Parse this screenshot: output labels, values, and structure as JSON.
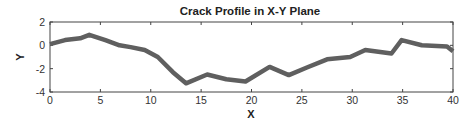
{
  "chart_data": {
    "type": "line",
    "title": "Crack Profile in X-Y Plane",
    "xlabel": "X",
    "ylabel": "Y",
    "xlim": [
      0,
      40
    ],
    "ylim": [
      -4,
      2
    ],
    "xticks": [
      0,
      5,
      10,
      15,
      20,
      25,
      30,
      35,
      40
    ],
    "yticks": [
      -4,
      -2,
      0,
      2
    ],
    "grid": false,
    "legend": null,
    "line_color": "#5f5f5f",
    "series": [
      {
        "name": "Crack Profile",
        "x": [
          0,
          1.5,
          3.0,
          3.9,
          5.5,
          6.9,
          8.0,
          9.4,
          10.7,
          12.2,
          13.5,
          15.6,
          17.5,
          19.4,
          21.8,
          23.7,
          25.5,
          27.5,
          29.8,
          31.3,
          33.9,
          34.9,
          36.9,
          39.4,
          40
        ],
        "y": [
          0.1,
          0.45,
          0.6,
          0.9,
          0.45,
          0.0,
          -0.15,
          -0.4,
          -1.0,
          -2.3,
          -3.25,
          -2.5,
          -2.9,
          -3.1,
          -1.85,
          -2.55,
          -1.9,
          -1.2,
          -1.0,
          -0.4,
          -0.7,
          0.45,
          0.0,
          -0.1,
          -0.5
        ]
      }
    ]
  }
}
